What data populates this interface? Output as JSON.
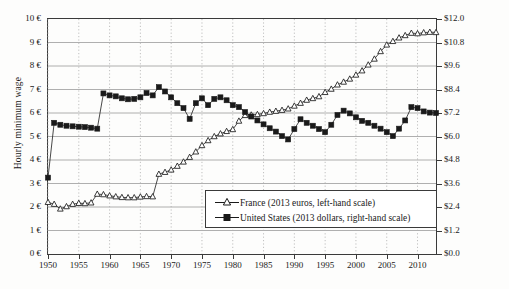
{
  "chart_data": {
    "type": "line",
    "title": "",
    "xlabel": "",
    "ylabel": "Hourly minimum wage",
    "ylabel_right": "",
    "grid": true,
    "legend_position": "inside-bottom-center",
    "xlim": [
      1950,
      2013
    ],
    "ylim_left": [
      0,
      10
    ],
    "ylim_right": [
      0,
      12
    ],
    "xticks": [
      1950,
      1955,
      1960,
      1965,
      1970,
      1975,
      1980,
      1985,
      1990,
      1995,
      2000,
      2005,
      2010
    ],
    "xticklabels": [
      "1950",
      "1955",
      "1960",
      "1965",
      "1970",
      "1975",
      "1980",
      "1985",
      "1990",
      "1995",
      "2000",
      "2005",
      "2010"
    ],
    "yticks_left": [
      0,
      1,
      2,
      3,
      4,
      5,
      6,
      7,
      8,
      9,
      10
    ],
    "yticklabels_left": [
      "0 €",
      "1 €",
      "2 €",
      "3 €",
      "4 €",
      "5 €",
      "6 €",
      "7 €",
      "8 €",
      "9 €",
      "10 €"
    ],
    "yticks_right": [
      0,
      1.2,
      2.4,
      3.6,
      4.8,
      6.0,
      7.2,
      8.4,
      9.6,
      10.8,
      12.0
    ],
    "yticklabels_right": [
      "$0.0",
      "$1.2",
      "$2.4",
      "$3.6",
      "$4.8",
      "$6.0",
      "$7.2",
      "$8.4",
      "$9.6",
      "$10.8",
      "$12.0"
    ],
    "series": [
      {
        "name": "France (2013 euros, left-hand scale)",
        "axis": "left",
        "marker": "open-triangle",
        "color": "#1a1a1a",
        "x": [
          1950,
          1951,
          1952,
          1953,
          1954,
          1955,
          1956,
          1957,
          1958,
          1959,
          1960,
          1961,
          1962,
          1963,
          1964,
          1965,
          1966,
          1967,
          1968,
          1969,
          1970,
          1971,
          1972,
          1973,
          1974,
          1975,
          1976,
          1977,
          1978,
          1979,
          1980,
          1981,
          1982,
          1983,
          1984,
          1985,
          1986,
          1987,
          1988,
          1989,
          1990,
          1991,
          1992,
          1993,
          1994,
          1995,
          1996,
          1997,
          1998,
          1999,
          2000,
          2001,
          2002,
          2003,
          2004,
          2005,
          2006,
          2007,
          2008,
          2009,
          2010,
          2011,
          2012,
          2013
        ],
        "y": [
          2.2,
          2.12,
          1.92,
          2.02,
          2.12,
          2.16,
          2.15,
          2.18,
          2.55,
          2.53,
          2.48,
          2.44,
          2.41,
          2.4,
          2.4,
          2.43,
          2.45,
          2.44,
          3.4,
          3.48,
          3.58,
          3.74,
          3.92,
          4.12,
          4.35,
          4.62,
          4.83,
          5.0,
          5.12,
          5.22,
          5.3,
          5.66,
          5.9,
          5.92,
          5.94,
          5.98,
          6.04,
          6.08,
          6.12,
          6.18,
          6.3,
          6.42,
          6.55,
          6.62,
          6.7,
          6.88,
          7.02,
          7.2,
          7.32,
          7.45,
          7.62,
          7.8,
          8.05,
          8.3,
          8.62,
          8.9,
          9.05,
          9.2,
          9.3,
          9.4,
          9.38,
          9.42,
          9.44,
          9.43
        ]
      },
      {
        "name": "United States (2013 dollars, right-hand scale)",
        "axis": "right",
        "marker": "filled-square",
        "color": "#1a1a1a",
        "x": [
          1950,
          1951,
          1952,
          1953,
          1954,
          1955,
          1956,
          1957,
          1958,
          1959,
          1960,
          1961,
          1962,
          1963,
          1964,
          1965,
          1966,
          1967,
          1968,
          1969,
          1970,
          1971,
          1972,
          1973,
          1974,
          1975,
          1976,
          1977,
          1978,
          1979,
          1980,
          1981,
          1982,
          1983,
          1984,
          1985,
          1986,
          1987,
          1988,
          1989,
          1990,
          1991,
          1992,
          1993,
          1994,
          1995,
          1996,
          1997,
          1998,
          1999,
          2000,
          2001,
          2002,
          2003,
          2004,
          2005,
          2006,
          2007,
          2008,
          2009,
          2010,
          2011,
          2012,
          2013
        ],
        "y": [
          3.9,
          6.7,
          6.6,
          6.55,
          6.52,
          6.5,
          6.48,
          6.45,
          6.4,
          8.2,
          8.1,
          8.05,
          7.95,
          7.9,
          7.92,
          8.0,
          8.22,
          8.1,
          8.52,
          8.3,
          8.0,
          7.7,
          7.45,
          6.9,
          7.7,
          7.95,
          7.6,
          7.92,
          8.0,
          7.85,
          7.6,
          7.5,
          7.25,
          7.02,
          6.82,
          6.62,
          6.42,
          6.25,
          6.02,
          5.85,
          6.38,
          6.88,
          6.7,
          6.55,
          6.38,
          6.22,
          6.6,
          7.1,
          7.32,
          7.18,
          6.98,
          6.8,
          6.7,
          6.55,
          6.4,
          6.22,
          6.02,
          6.4,
          6.82,
          7.5,
          7.45,
          7.28,
          7.22,
          7.2
        ]
      }
    ]
  },
  "axes": {
    "ylabel_left_text": "Hourly minimum wage"
  },
  "legend": {
    "items": [
      {
        "label": "France (2013 euros, left-hand scale)",
        "marker": "open-triangle"
      },
      {
        "label": "United States (2013 dollars, right-hand scale)",
        "marker": "filled-square"
      }
    ]
  }
}
